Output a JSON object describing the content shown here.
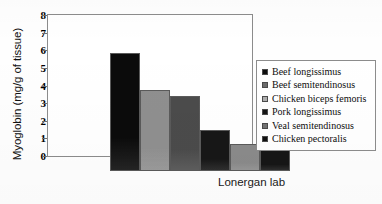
{
  "caption": "Lonergan lab",
  "legend": {
    "items": [
      {
        "label": "Beef longissimus",
        "color": "#0d0d0d"
      },
      {
        "label": "Beef semitendinosus",
        "color": "#6b6b6b"
      },
      {
        "label": "Chicken biceps femoris",
        "color": "#aeaeae"
      },
      {
        "label": "Pork longissimus",
        "color": "#141414"
      },
      {
        "label": "Veal semitendinosus",
        "color": "#737373"
      },
      {
        "label": "Chicken pectoralis",
        "color": "#101010"
      }
    ]
  },
  "chart_data": {
    "type": "bar",
    "title": "",
    "xlabel": "",
    "ylabel": "Myoglobin (mg/g of tissue)",
    "categories": [
      "Beef longissimus",
      "Beef semitendinosus",
      "Chicken biceps femoris",
      "Pork longissimus",
      "Veal semitendinosus",
      "Chicken pectoralis"
    ],
    "values": [
      6.7,
      4.6,
      4.25,
      2.3,
      1.55,
      1.25
    ],
    "bar_colors": [
      "#0b0b0b",
      "#8f8f8f",
      "#4b4b4b",
      "#171717",
      "#8a8a8a",
      "#161616"
    ],
    "ylim": [
      0,
      8
    ],
    "yticks": [
      0,
      1,
      2,
      3,
      4,
      5,
      6,
      7,
      8
    ],
    "ytick_labels": [
      "0",
      "1",
      "2",
      "3",
      "4",
      "5",
      "6",
      "7",
      "8"
    ],
    "grid": false,
    "legend_position": "right",
    "annotations": [
      "Lonergan lab"
    ]
  }
}
